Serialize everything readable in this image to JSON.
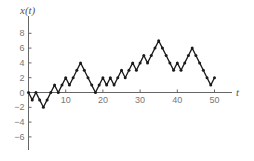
{
  "chart_data": {
    "type": "line",
    "title": "",
    "xlabel": "t",
    "ylabel": "x(t)",
    "xlim": [
      0,
      55
    ],
    "ylim": [
      -7.5,
      9.5
    ],
    "xticks": [
      10,
      20,
      30,
      40,
      50
    ],
    "yticks": [
      8,
      6,
      4,
      2,
      0,
      -2,
      -4,
      -6
    ],
    "grid": false,
    "legend": null,
    "series": [
      {
        "name": "x(t)",
        "marker": "dot",
        "color": "#1a1a1a",
        "x": [
          0,
          1,
          2,
          3,
          4,
          5,
          6,
          7,
          8,
          9,
          10,
          11,
          12,
          13,
          14,
          15,
          16,
          17,
          18,
          19,
          20,
          21,
          22,
          23,
          24,
          25,
          26,
          27,
          28,
          29,
          30,
          31,
          32,
          33,
          34,
          35,
          36,
          37,
          38,
          39,
          40,
          41,
          42,
          43,
          44,
          45,
          46,
          47,
          48,
          49,
          50
        ],
        "values": [
          0,
          -1,
          0,
          -1,
          -2,
          -1,
          0,
          1,
          0,
          1,
          2,
          1,
          2,
          3,
          4,
          3,
          2,
          1,
          0,
          1,
          2,
          1,
          2,
          1,
          2,
          3,
          2,
          3,
          4,
          3,
          4,
          5,
          4,
          5,
          6,
          7,
          6,
          5,
          4,
          3,
          4,
          3,
          4,
          5,
          6,
          5,
          4,
          3,
          2,
          1,
          2
        ]
      }
    ]
  },
  "labels": {
    "y_axis_title": "x(t)",
    "x_axis_title": "t"
  },
  "colors": {
    "axis": "#666666",
    "line": "#1a1a1a",
    "tick_text": "#777777"
  }
}
